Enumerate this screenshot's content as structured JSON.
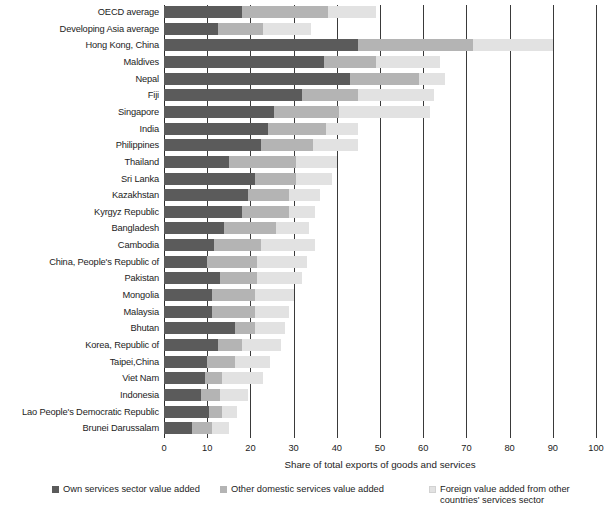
{
  "chart_data": {
    "type": "bar",
    "orientation": "horizontal",
    "stacked": true,
    "title": "",
    "xlabel": "Share of total exports of goods and services",
    "ylabel": "",
    "xlim": [
      0,
      100
    ],
    "xticks": [
      0,
      10,
      20,
      30,
      40,
      50,
      60,
      70,
      80,
      90,
      100
    ],
    "grid": true,
    "grid_axis": "x",
    "legend_position": "bottom",
    "categories": [
      "OECD average",
      "Developing Asia average",
      "Hong Kong, China",
      "Maldives",
      "Nepal",
      "Fiji",
      "Singapore",
      "India",
      "Philippines",
      "Thailand",
      "Sri Lanka",
      "Kazakhstan",
      "Kyrgyz Republic",
      "Bangladesh",
      "Cambodia",
      "China, People's Republic of",
      "Pakistan",
      "Mongolia",
      "Malaysia",
      "Bhutan",
      "Korea, Republic of",
      "Taipei,China",
      "Viet Nam",
      "Indonesia",
      "Lao People's Democratic Republic",
      "Brunei Darussalam"
    ],
    "series": [
      {
        "name": "Own services sector value added",
        "color": "#5b5b5b",
        "values": [
          18.0,
          12.5,
          45.0,
          37.0,
          43.0,
          32.0,
          25.5,
          24.0,
          22.5,
          15.0,
          21.0,
          19.5,
          18.0,
          14.0,
          11.5,
          10.0,
          13.0,
          11.0,
          11.0,
          16.5,
          12.5,
          10.0,
          9.5,
          8.5,
          10.5,
          6.5
        ]
      },
      {
        "name": "Other domestic services value added",
        "color": "#b4b4b4",
        "values": [
          20.0,
          10.5,
          26.5,
          12.0,
          16.0,
          13.0,
          15.0,
          13.5,
          12.0,
          15.5,
          9.5,
          9.5,
          11.0,
          12.0,
          11.0,
          11.5,
          8.5,
          10.0,
          10.0,
          4.5,
          5.5,
          6.5,
          4.0,
          4.5,
          3.0,
          4.5
        ]
      },
      {
        "name": "Foreign value added from other countries' services sector",
        "color": "#e2e2e2",
        "values": [
          11.0,
          11.0,
          18.5,
          15.0,
          6.0,
          17.5,
          21.0,
          7.5,
          10.5,
          9.5,
          8.5,
          7.0,
          6.0,
          7.5,
          12.5,
          11.5,
          10.5,
          9.0,
          8.0,
          7.0,
          9.0,
          8.0,
          9.5,
          6.5,
          3.5,
          4.0
        ]
      }
    ],
    "legend": [
      "Own services sector value added",
      "Other domestic services value added",
      "Foreign value added from other countries' services sector"
    ],
    "legend_line2": "countries' services sector"
  }
}
